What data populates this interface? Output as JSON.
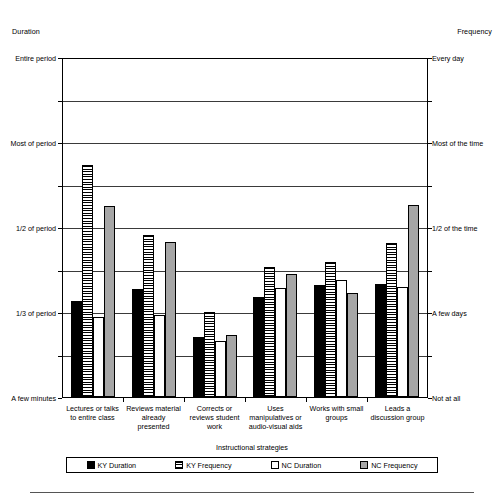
{
  "axis_captions": {
    "left": "Duration",
    "right": "Frequency"
  },
  "xaxis_title": "Instructional strategies",
  "legend": {
    "items": [
      {
        "label": "KY Duration",
        "key": "kyd",
        "pattern": "solid-black"
      },
      {
        "label": "KY Frequency",
        "key": "kyf",
        "pattern": "horizontal-stripes"
      },
      {
        "label": "NC Duration",
        "key": "ncd",
        "pattern": "white"
      },
      {
        "label": "NC Frequency",
        "key": "ncf",
        "pattern": "gray"
      }
    ]
  },
  "chart_data": {
    "type": "bar",
    "title": "",
    "xlabel": "Instructional strategies",
    "ylabel": "Duration",
    "y2label": "Frequency",
    "grid": true,
    "legend_position": "bottom",
    "ylim": [
      0,
      8
    ],
    "yticks": [
      0,
      1,
      2,
      3,
      4,
      5,
      6,
      7,
      8
    ],
    "ytick_labels_left": [
      {
        "value": 0,
        "label": "A few minutes"
      },
      {
        "value": 2,
        "label": "1/3 of period"
      },
      {
        "value": 4,
        "label": "1/2 of period"
      },
      {
        "value": 6,
        "label": "Most of period"
      },
      {
        "value": 8,
        "label": "Entire period"
      }
    ],
    "ytick_labels_right": [
      {
        "value": 0,
        "label": "Not at all"
      },
      {
        "value": 2,
        "label": "A few days"
      },
      {
        "value": 4,
        "label": "1/2 of the time"
      },
      {
        "value": 6,
        "label": "Most of the time"
      },
      {
        "value": 8,
        "label": "Every day"
      }
    ],
    "categories": [
      "Lectures or talks to entire class",
      "Reviews material already presented",
      "Corrects or reviews student work",
      "Uses manipulatives or audio-visual aids",
      "Works with small groups",
      "Leads a discussion group"
    ],
    "category_lines": [
      [
        "Lectures or talks",
        "to entire class"
      ],
      [
        "Reviews material",
        "already",
        "presented"
      ],
      [
        "Corrects or",
        "reviews student",
        "work"
      ],
      [
        "Uses",
        "manipulatives or",
        "audio-visual aids"
      ],
      [
        "Works with small",
        "groups"
      ],
      [
        "Leads a",
        "discussion group"
      ]
    ],
    "series": [
      {
        "name": "KY Duration",
        "color": "#000000",
        "values": [
          2.26,
          2.54,
          1.41,
          2.35,
          2.64,
          2.66
        ]
      },
      {
        "name": "KY Frequency",
        "color": "#ffffff",
        "values": [
          5.46,
          3.81,
          2.0,
          3.06,
          3.18,
          3.62
        ]
      },
      {
        "name": "NC Duration",
        "color": "#ffffff",
        "values": [
          1.88,
          1.93,
          1.32,
          2.56,
          2.75,
          2.59
        ]
      },
      {
        "name": "NC Frequency",
        "color": "#a6a6a6",
        "values": [
          4.49,
          3.65,
          1.46,
          2.89,
          2.45,
          4.52
        ]
      }
    ]
  }
}
